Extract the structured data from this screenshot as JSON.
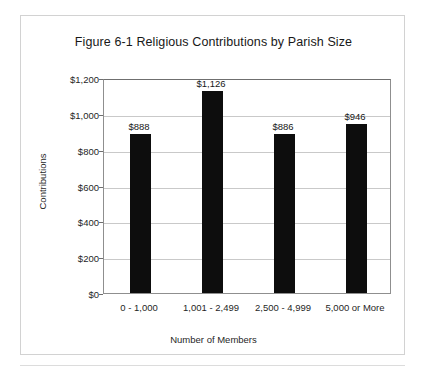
{
  "chart_data": {
    "type": "bar",
    "title": "Figure 6-1 Religious Contributions by Parish Size",
    "xlabel": "Number of Members",
    "ylabel": "Contributions",
    "categories": [
      "0 - 1,000",
      "1,001 - 2,499",
      "2,500 - 4,999",
      "5,000 or More"
    ],
    "values": [
      888,
      1126,
      886,
      946
    ],
    "value_labels": [
      "$888",
      "$1,126",
      "$886",
      "$946"
    ],
    "ylim": [
      0,
      1200
    ],
    "ytick_values": [
      0,
      200,
      400,
      600,
      800,
      1000,
      1200
    ],
    "ytick_labels": [
      "$0",
      "$200",
      "$400",
      "$600",
      "$800",
      "$1,000",
      "$1,200"
    ],
    "grid": true,
    "legend": "none",
    "bar_color": "#0d0d0d",
    "gridline_color": "#c9c9c9",
    "axis_color": "#8f8f8f",
    "plot_background": "#ffffff"
  }
}
